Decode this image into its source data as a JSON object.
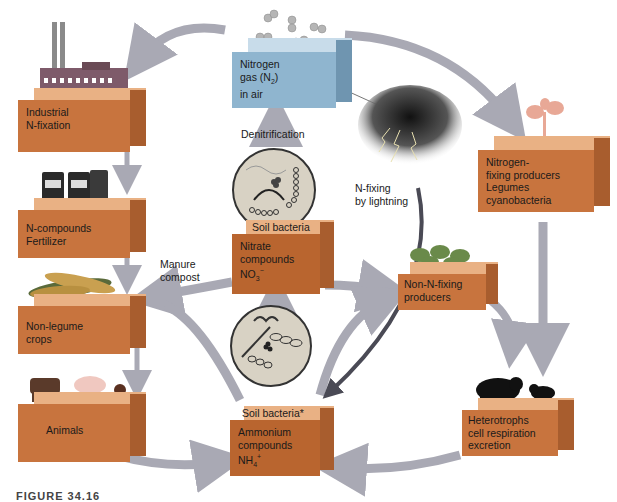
{
  "diagram": {
    "nodes": {
      "industrial": {
        "line1": "Industrial",
        "line2": "N-fixation"
      },
      "fertilizer": {
        "line1": "N-compounds",
        "line2": "Fertilizer"
      },
      "crops": {
        "line1": "Non-legume",
        "line2": "crops"
      },
      "animals": {
        "line1": "Animals"
      },
      "nitrogen_gas": {
        "line1": "Nitrogen",
        "line2_pre": "gas (N",
        "line2_sub": "2",
        "line2_post": ")",
        "line3": "in air"
      },
      "nitrate": {
        "top_label": "Soil bacteria",
        "line1": "Nitrate",
        "line2": "compounds",
        "line3_pre": "NO",
        "line3_sub": "3",
        "line3_sup": "−"
      },
      "ammonium": {
        "top_label": "Soil bacteria*",
        "line1": "Ammonium",
        "line2": "compounds",
        "line3_pre": "NH",
        "line3_sub": "4",
        "line3_sup": "+"
      },
      "fixing_producers": {
        "line1": "Nitrogen-",
        "line2": "fixing producers",
        "line3": "Legumes",
        "line4": "cyanobacteria"
      },
      "non_fixing": {
        "line1": "Non-N-fixing",
        "line2": "producers"
      },
      "heterotrophs": {
        "line1": "Heterotrophs",
        "line2": "cell respiration",
        "line3": "excretion"
      }
    },
    "labels": {
      "denitrification": "Denitrification",
      "lightning": "N-fixing\nby lightning",
      "manure": "Manure\ncompost"
    },
    "caption": "FIGURE 34.16"
  }
}
